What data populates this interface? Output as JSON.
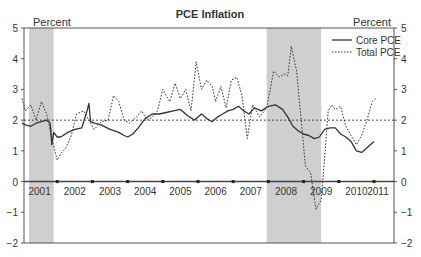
{
  "chart_data": {
    "type": "line",
    "title": "PCE Inflation",
    "ylabel_left": "Percent",
    "ylabel_right": "Percent",
    "xlabel": "",
    "ylim": [
      -2,
      5
    ],
    "yticks": [
      -2,
      -1,
      0,
      1,
      2,
      3,
      4,
      5
    ],
    "xticks_labels": [
      "2001",
      "2002",
      "2003",
      "2004",
      "2005",
      "2006",
      "2007",
      "2008",
      "2009",
      "2010",
      "2011"
    ],
    "xlim": [
      2001.0,
      2011.1
    ],
    "reference_line": {
      "y": 2,
      "style": "dotted"
    },
    "zero_line": {
      "y": 0,
      "style": "solid",
      "year_markers": true
    },
    "recessions": [
      {
        "start": 2001.2,
        "end": 2001.9
      },
      {
        "start": 2007.95,
        "end": 2009.5
      }
    ],
    "legend": {
      "position": "upper right",
      "entries": [
        "Core PCE",
        "Total PCE"
      ]
    },
    "grid": false,
    "series": [
      {
        "name": "Core PCE",
        "style": "solid",
        "x": [
          2001.0,
          2001.1,
          2001.25,
          2001.4,
          2001.55,
          2001.7,
          2001.8,
          2001.85,
          2001.9,
          2002.0,
          2002.1,
          2002.3,
          2002.5,
          2002.7,
          2002.85,
          2002.9,
          2002.95,
          2003.05,
          2003.25,
          2003.5,
          2003.75,
          2003.9,
          2004.0,
          2004.15,
          2004.3,
          2004.5,
          2004.7,
          2004.9,
          2005.1,
          2005.3,
          2005.5,
          2005.7,
          2005.9,
          2006.0,
          2006.1,
          2006.25,
          2006.4,
          2006.55,
          2006.7,
          2006.85,
          2007.0,
          2007.15,
          2007.3,
          2007.45,
          2007.6,
          2007.8,
          2008.0,
          2008.2,
          2008.4,
          2008.55,
          2008.7,
          2008.85,
          2009.0,
          2009.15,
          2009.3,
          2009.45,
          2009.6,
          2009.75,
          2009.9,
          2010.05,
          2010.2,
          2010.35,
          2010.5,
          2010.65,
          2010.8,
          2011.0
        ],
        "values": [
          1.9,
          1.85,
          1.8,
          1.9,
          1.95,
          2.0,
          1.9,
          1.2,
          1.6,
          1.45,
          1.45,
          1.6,
          1.7,
          1.75,
          2.3,
          2.55,
          1.95,
          1.9,
          1.85,
          1.7,
          1.6,
          1.5,
          1.45,
          1.55,
          1.75,
          2.05,
          2.2,
          2.2,
          2.25,
          2.3,
          2.35,
          2.15,
          2.0,
          2.1,
          2.2,
          2.05,
          1.95,
          2.1,
          2.2,
          2.3,
          2.35,
          2.45,
          2.3,
          2.2,
          2.4,
          2.3,
          2.45,
          2.5,
          2.35,
          2.1,
          1.8,
          1.65,
          1.55,
          1.5,
          1.4,
          1.45,
          1.7,
          1.75,
          1.75,
          1.55,
          1.45,
          1.3,
          1.0,
          0.95,
          1.1,
          1.3
        ]
      },
      {
        "name": "Total PCE",
        "style": "dotted",
        "x": [
          2001.0,
          2001.1,
          2001.25,
          2001.4,
          2001.55,
          2001.7,
          2001.85,
          2002.0,
          2002.1,
          2002.25,
          2002.4,
          2002.55,
          2002.75,
          2002.9,
          2003.05,
          2003.25,
          2003.45,
          2003.6,
          2003.75,
          2003.9,
          2004.05,
          2004.25,
          2004.4,
          2004.55,
          2004.7,
          2004.85,
          2005.0,
          2005.2,
          2005.35,
          2005.5,
          2005.65,
          2005.8,
          2005.95,
          2006.1,
          2006.25,
          2006.4,
          2006.5,
          2006.65,
          2006.8,
          2006.95,
          2007.1,
          2007.25,
          2007.4,
          2007.55,
          2007.75,
          2007.95,
          2008.15,
          2008.3,
          2008.45,
          2008.55,
          2008.65,
          2008.8,
          2008.95,
          2009.05,
          2009.2,
          2009.35,
          2009.5,
          2009.6,
          2009.7,
          2009.8,
          2009.9,
          2010.05,
          2010.2,
          2010.35,
          2010.5,
          2010.65,
          2010.8,
          2010.95,
          2011.05
        ],
        "values": [
          2.7,
          2.3,
          2.5,
          2.0,
          2.6,
          2.2,
          1.4,
          0.7,
          0.9,
          1.1,
          1.5,
          2.2,
          2.3,
          2.0,
          1.7,
          1.95,
          2.0,
          2.8,
          2.6,
          2.0,
          1.9,
          2.1,
          2.3,
          2.0,
          2.1,
          2.3,
          3.0,
          2.6,
          3.2,
          2.7,
          3.0,
          2.3,
          3.9,
          3.0,
          3.3,
          3.1,
          2.6,
          3.1,
          2.4,
          3.3,
          3.4,
          2.8,
          1.4,
          2.5,
          2.1,
          2.4,
          3.6,
          3.4,
          3.5,
          3.45,
          4.4,
          3.6,
          1.8,
          0.5,
          0.3,
          -0.9,
          -0.6,
          0.8,
          2.3,
          2.5,
          2.35,
          2.45,
          1.8,
          1.5,
          1.2,
          1.5,
          2.0,
          2.6,
          2.7
        ]
      }
    ]
  },
  "labels": {
    "title": "PCE Inflation",
    "percent_left": "Percent",
    "percent_right": "Percent",
    "legend_core": "Core PCE",
    "legend_total": "Total PCE"
  },
  "colors": {
    "line": "#333333",
    "frame": "#555555",
    "recession": "#cfcfcf",
    "text": "#333333"
  }
}
